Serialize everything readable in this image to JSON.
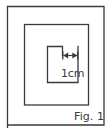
{
  "figure": {
    "caption": "Fig. 1",
    "background_color": "#ffffff",
    "stroke_color": "#3a3a3a",
    "text_color": "#3a3a3a",
    "stroke_width": 1.3,
    "shapes": {
      "outer_square": {
        "name": "outer square",
        "x": 7.5,
        "y": 6.5,
        "width": 96.5,
        "height": 118.5,
        "note": "left edge runs to bottom of frame"
      },
      "middle_square": {
        "name": "middle square",
        "x": 24.5,
        "y": 24.5,
        "width": 64,
        "height": 80.5
      },
      "inner_shape": {
        "name": "inner notched rectangle",
        "left": 47.5,
        "top": 46.5,
        "right": 78,
        "bottom": 82.5,
        "notch_x": 62.5,
        "notch_depth": 9
      }
    },
    "dimension": {
      "label": "1cm",
      "arrow_y": 55.5,
      "arrow_x1": 62.5,
      "arrow_x2": 78,
      "tick_half_height": 4,
      "label_x": 62,
      "label_y": 76
    },
    "caption_position": {
      "x": 74,
      "y": 119
    }
  }
}
